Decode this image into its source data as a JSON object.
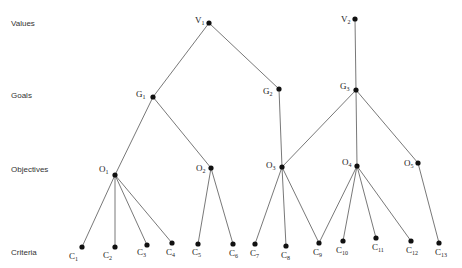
{
  "diagram": {
    "type": "hierarchy",
    "levels": [
      {
        "id": "values",
        "label": "Values",
        "y": 23
      },
      {
        "id": "goals",
        "label": "Goals",
        "y": 95
      },
      {
        "id": "objectives",
        "label": "Objectives",
        "y": 169
      },
      {
        "id": "criteria",
        "label": "Criteria",
        "y": 252
      }
    ],
    "nodes": [
      {
        "id": "V1",
        "letter": "V",
        "sub": "1",
        "x": 209,
        "y": 23,
        "lx": -14,
        "ly": 0
      },
      {
        "id": "V2",
        "letter": "V",
        "sub": "2",
        "x": 355,
        "y": 19,
        "lx": -14,
        "ly": 3
      },
      {
        "id": "G1",
        "letter": "G",
        "sub": "1",
        "x": 153,
        "y": 97,
        "lx": -17,
        "ly": 0
      },
      {
        "id": "G2",
        "letter": "G",
        "sub": "2",
        "x": 279,
        "y": 89,
        "lx": -16,
        "ly": 5
      },
      {
        "id": "G3",
        "letter": "G",
        "sub": "3",
        "x": 356,
        "y": 90,
        "lx": -16,
        "ly": -1
      },
      {
        "id": "O1",
        "letter": "O",
        "sub": "1",
        "x": 115,
        "y": 175,
        "lx": -16,
        "ly": -3
      },
      {
        "id": "O2",
        "letter": "O",
        "sub": "2",
        "x": 211,
        "y": 168,
        "lx": -15,
        "ly": 3
      },
      {
        "id": "O3",
        "letter": "O",
        "sub": "3",
        "x": 282,
        "y": 167,
        "lx": -16,
        "ly": 1
      },
      {
        "id": "O4",
        "letter": "O",
        "sub": "4",
        "x": 357,
        "y": 166,
        "lx": -15,
        "ly": -1
      },
      {
        "id": "O5",
        "letter": "O",
        "sub": "5",
        "x": 418,
        "y": 163,
        "lx": -14,
        "ly": 3
      },
      {
        "id": "C1",
        "letter": "C",
        "sub": "1",
        "x": 82,
        "y": 247,
        "lx": -13,
        "ly": 12
      },
      {
        "id": "C2",
        "letter": "C",
        "sub": "2",
        "x": 115,
        "y": 247,
        "lx": -12,
        "ly": 11
      },
      {
        "id": "C3",
        "letter": "C",
        "sub": "3",
        "x": 147,
        "y": 245,
        "lx": -10,
        "ly": 10
      },
      {
        "id": "C4",
        "letter": "C",
        "sub": "4",
        "x": 172,
        "y": 243,
        "lx": -6,
        "ly": 12
      },
      {
        "id": "C5",
        "letter": "C",
        "sub": "5",
        "x": 198,
        "y": 244,
        "lx": -6,
        "ly": 11
      },
      {
        "id": "C6",
        "letter": "C",
        "sub": "6",
        "x": 233,
        "y": 244,
        "lx": -4,
        "ly": 12
      },
      {
        "id": "C7",
        "letter": "C",
        "sub": "7",
        "x": 255,
        "y": 244,
        "lx": -5,
        "ly": 12
      },
      {
        "id": "C8",
        "letter": "C",
        "sub": "8",
        "x": 286,
        "y": 246,
        "lx": -5,
        "ly": 12
      },
      {
        "id": "C9",
        "letter": "C",
        "sub": "9",
        "x": 319,
        "y": 243,
        "lx": -6,
        "ly": 12
      },
      {
        "id": "C10",
        "letter": "C",
        "sub": "10",
        "x": 343,
        "y": 241,
        "lx": -7,
        "ly": 12
      },
      {
        "id": "C11",
        "letter": "C",
        "sub": "11",
        "x": 376,
        "y": 238,
        "lx": -4,
        "ly": 12
      },
      {
        "id": "C12",
        "letter": "C",
        "sub": "12",
        "x": 411,
        "y": 241,
        "lx": -5,
        "ly": 12
      },
      {
        "id": "C13",
        "letter": "C",
        "sub": "13",
        "x": 439,
        "y": 243,
        "lx": -4,
        "ly": 12
      }
    ],
    "edges": [
      [
        "V1",
        "G1"
      ],
      [
        "V1",
        "G2"
      ],
      [
        "V2",
        "G3"
      ],
      [
        "G1",
        "O1"
      ],
      [
        "G1",
        "O2"
      ],
      [
        "G2",
        "O3"
      ],
      [
        "G3",
        "O3"
      ],
      [
        "G3",
        "O4"
      ],
      [
        "G3",
        "O5"
      ],
      [
        "O1",
        "C1"
      ],
      [
        "O1",
        "C2"
      ],
      [
        "O1",
        "C3"
      ],
      [
        "O1",
        "C4"
      ],
      [
        "O2",
        "C5"
      ],
      [
        "O2",
        "C6"
      ],
      [
        "O3",
        "C7"
      ],
      [
        "O3",
        "C8"
      ],
      [
        "O3",
        "C9"
      ],
      [
        "O4",
        "C9"
      ],
      [
        "O4",
        "C10"
      ],
      [
        "O4",
        "C11"
      ],
      [
        "O4",
        "C12"
      ],
      [
        "O5",
        "C13"
      ]
    ],
    "colors": {
      "line": "#555555",
      "node": "#111111",
      "text": "#222222"
    }
  }
}
